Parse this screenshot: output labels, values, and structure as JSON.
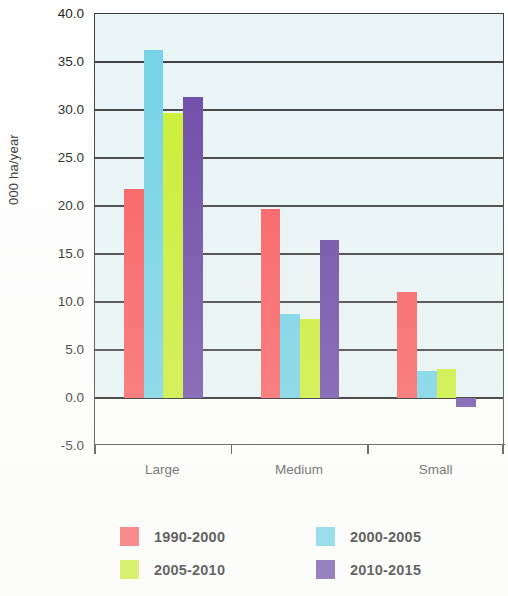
{
  "chart_data": {
    "type": "bar",
    "title": "",
    "subtitle": "",
    "xlabel": "",
    "ylabel": "000 ha/year",
    "categories": [
      "Large",
      "Medium",
      "Small"
    ],
    "series": [
      {
        "name": "1990-2000",
        "color": "#f95b5e",
        "values": [
          21.8,
          19.7,
          11.0
        ]
      },
      {
        "name": "2000-2005",
        "color": "#72d2e6",
        "values": [
          36.2,
          8.8,
          2.8
        ]
      },
      {
        "name": "2005-2010",
        "color": "#caee30",
        "values": [
          29.7,
          8.2,
          3.0
        ]
      },
      {
        "name": "2010-2015",
        "color": "#6a47a6",
        "values": [
          31.4,
          16.5,
          -0.9
        ]
      }
    ],
    "ylim": [
      -5.0,
      40.0
    ],
    "ytick_values": [
      40.0,
      35.0,
      30.0,
      25.0,
      20.0,
      15.0,
      10.0,
      5.0,
      0.0,
      -5.0
    ],
    "ytick_labels": [
      "40.0",
      "35.0",
      "30.0",
      "25.0",
      "20.0",
      "15.0",
      "10.0",
      "5.0",
      "0.0",
      "-5.0"
    ],
    "grid": true,
    "grid_axis": "y",
    "legend_position": "bottom",
    "plot_background": "#e8f4f6"
  },
  "legend": {
    "entries": [
      {
        "label": "1990-2000",
        "color": "#f95b5e"
      },
      {
        "label": "2000-2005",
        "color": "#72d2e6"
      },
      {
        "label": "2005-2010",
        "color": "#caee30"
      },
      {
        "label": "2010-2015",
        "color": "#6a47a6"
      }
    ]
  }
}
